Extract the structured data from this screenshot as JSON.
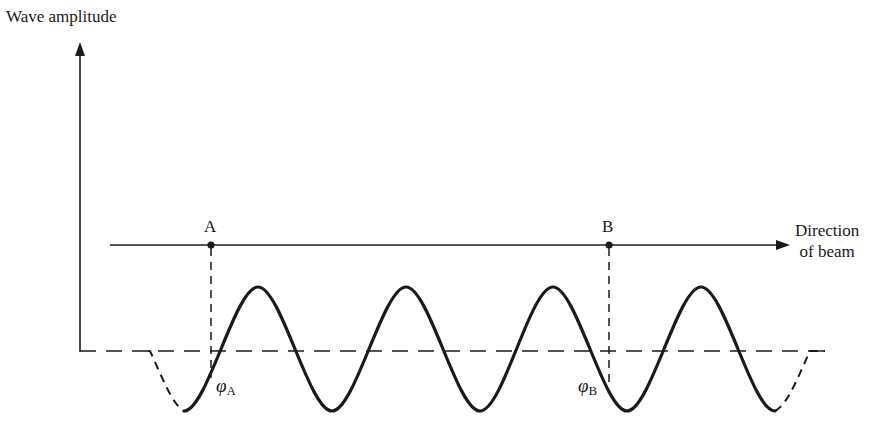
{
  "diagram": {
    "type": "wave-phase-diagram",
    "y_axis_label": "Wave amplitude",
    "beam_direction_label_line1": "Direction",
    "beam_direction_label_line2": "of beam",
    "points": [
      {
        "name": "A",
        "x": 211
      },
      {
        "name": "B",
        "x": 609
      }
    ],
    "phase_labels": [
      {
        "symbol": "φ",
        "subscript": "A"
      },
      {
        "symbol": "φ",
        "subscript": "B"
      }
    ],
    "wave": {
      "center_y": 349,
      "amplitude": 62,
      "period": 148,
      "solid_start_x": 184,
      "solid_end_x": 775,
      "dashed_left_start_x": 148,
      "dashed_right_end_x": 808,
      "peaks_x": [
        258,
        406,
        553,
        701
      ],
      "troughs_x": [
        184,
        332,
        480,
        627,
        775
      ]
    },
    "colors": {
      "stroke": "#1a1a1a",
      "background": "#ffffff"
    }
  }
}
